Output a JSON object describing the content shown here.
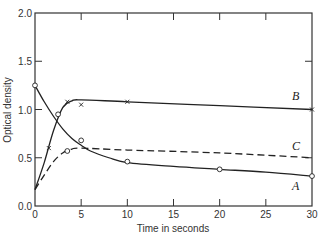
{
  "chart_data": {
    "type": "line",
    "title": "",
    "xlabel": "Time in seconds",
    "ylabel": "Optical density",
    "xlim": [
      0,
      30
    ],
    "ylim": [
      0.0,
      2.0
    ],
    "x_ticks": [
      "0",
      "5",
      "10",
      "15",
      "20",
      "25",
      "30"
    ],
    "y_ticks": [
      "0.0",
      "0.5",
      "1.0",
      "1.5",
      "2.0"
    ],
    "grid": false,
    "legend": "inline labels at right end of curves",
    "series": [
      {
        "name": "A",
        "style": "solid",
        "marker": "circle",
        "points": [
          [
            0,
            1.25
          ],
          [
            2.5,
            0.95
          ],
          [
            5,
            0.68
          ],
          [
            10,
            0.46
          ],
          [
            20,
            0.38
          ],
          [
            30,
            0.31
          ]
        ],
        "curve": [
          [
            0,
            1.25
          ],
          [
            1,
            1.08
          ],
          [
            2,
            0.93
          ],
          [
            3,
            0.8
          ],
          [
            4,
            0.7
          ],
          [
            5,
            0.63
          ],
          [
            6,
            0.57
          ],
          [
            8,
            0.5
          ],
          [
            10,
            0.45
          ],
          [
            15,
            0.41
          ],
          [
            20,
            0.38
          ],
          [
            25,
            0.35
          ],
          [
            30,
            0.31
          ]
        ]
      },
      {
        "name": "B",
        "style": "solid",
        "marker": "cross",
        "points": [
          [
            1.5,
            0.6
          ],
          [
            3.5,
            1.08
          ],
          [
            5,
            1.05
          ],
          [
            10,
            1.08
          ],
          [
            30,
            1.0
          ]
        ],
        "curve": [
          [
            0,
            0.17
          ],
          [
            1,
            0.45
          ],
          [
            2,
            0.78
          ],
          [
            3,
            1.02
          ],
          [
            4,
            1.09
          ],
          [
            5,
            1.1
          ],
          [
            10,
            1.08
          ],
          [
            20,
            1.04
          ],
          [
            30,
            1.0
          ]
        ]
      },
      {
        "name": "C",
        "style": "dashed",
        "marker": "circle",
        "points": [
          [
            3.5,
            0.57
          ]
        ],
        "curve": [
          [
            0,
            0.17
          ],
          [
            1,
            0.32
          ],
          [
            2,
            0.46
          ],
          [
            3,
            0.55
          ],
          [
            4,
            0.59
          ],
          [
            5,
            0.6
          ],
          [
            10,
            0.58
          ],
          [
            20,
            0.55
          ],
          [
            30,
            0.5
          ]
        ]
      }
    ]
  }
}
